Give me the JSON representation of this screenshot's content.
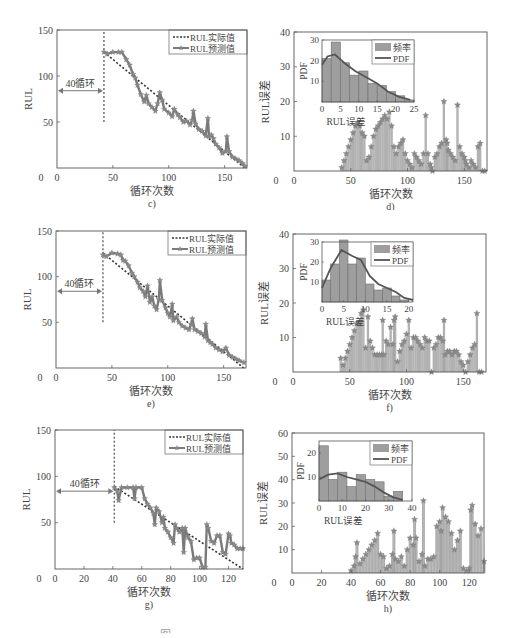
{
  "figure_caption_partial": "图",
  "colors": {
    "frame": "#555555",
    "actual_line": "#333333",
    "predicted_line": "#7a7a7a",
    "marker": "#8a8a8a",
    "bar_fill": "#9e9e9e",
    "bar_stroke": "#6f6f6f",
    "stem": "#bdbdbd",
    "pdf_line": "#555555",
    "text": "#444444"
  },
  "panels": [
    {
      "id": "c",
      "label": "c)",
      "type": "rul",
      "xlabel": "循环次数",
      "ylabel": "RUL",
      "annotation": "40循环",
      "legend": [
        "RUL实际值",
        "RUL预测值"
      ]
    },
    {
      "id": "d",
      "label": "d)",
      "type": "err",
      "xlabel": "循环次数",
      "ylabel": "RUL误差",
      "inset_xlabel": "RUL误差",
      "inset_ylabel": "PDF",
      "legend": [
        "频率",
        "PDF"
      ]
    },
    {
      "id": "e",
      "label": "e)",
      "type": "rul",
      "xlabel": "循环次数",
      "ylabel": "RUL",
      "annotation": "40循环",
      "legend": [
        "RUL实际值",
        "RUL预测值"
      ]
    },
    {
      "id": "f",
      "label": "f)",
      "type": "err",
      "xlabel": "循环次数",
      "ylabel": "RUL误差",
      "inset_xlabel": "RUL误差",
      "inset_ylabel": "PDF",
      "legend": [
        "频率",
        "PDF"
      ]
    },
    {
      "id": "g",
      "label": "g)",
      "type": "rul",
      "xlabel": "循环次数",
      "ylabel": "RUL",
      "annotation": "40循环",
      "legend": [
        "RUL实际值",
        "RUL预测值"
      ]
    },
    {
      "id": "h",
      "label": "h)",
      "type": "err",
      "xlabel": "循环次数",
      "ylabel": "RUL误差",
      "inset_xlabel": "RUL误差",
      "inset_ylabel": "PDF",
      "legend": [
        "频率",
        "PDF"
      ]
    }
  ],
  "chart_data": [
    {
      "panel": "c",
      "type": "line",
      "title": "c)",
      "xlabel": "循环次数",
      "ylabel": "RUL",
      "xlim": [
        0,
        170
      ],
      "ylim": [
        0,
        150
      ],
      "xticks": [
        0,
        50,
        100,
        150
      ],
      "yticks": [
        50,
        100,
        150
      ],
      "annotation": {
        "text": "40循环",
        "x_from": 0,
        "x_to": 42,
        "y": 84
      },
      "vline": {
        "x": 42,
        "y_from": 50,
        "y_to": 150
      },
      "legend": [
        "RUL实际值",
        "RUL预测值"
      ],
      "series": [
        {
          "name": "RUL实际值",
          "style": "dotted",
          "x": [
            42,
            168
          ],
          "y": [
            126,
            0
          ]
        },
        {
          "name": "RUL预测值",
          "style": "line-star",
          "x": [
            42,
            45,
            50,
            55,
            58,
            62,
            65,
            68,
            70,
            72,
            75,
            78,
            80,
            82,
            85,
            88,
            90,
            92,
            94,
            96,
            100,
            103,
            105,
            108,
            110,
            113,
            116,
            119,
            121,
            122,
            124,
            127,
            130,
            133,
            135,
            136,
            138,
            140,
            142,
            145,
            148,
            151,
            152,
            154,
            157,
            160,
            163,
            166,
            168
          ],
          "y": [
            126,
            124,
            126,
            126,
            126,
            118,
            112,
            102,
            98,
            90,
            80,
            72,
            79,
            70,
            66,
            62,
            70,
            82,
            74,
            64,
            60,
            56,
            64,
            58,
            55,
            50,
            51,
            47,
            52,
            62,
            48,
            42,
            40,
            35,
            54,
            34,
            36,
            32,
            26,
            22,
            16,
            18,
            34,
            18,
            12,
            10,
            8,
            5,
            2
          ]
        }
      ]
    },
    {
      "panel": "d",
      "type": "bar",
      "title": "d)",
      "xlabel": "循环次数",
      "ylabel": "RUL误差",
      "xlim": [
        0,
        170
      ],
      "ylim": [
        0,
        40
      ],
      "xticks": [
        0,
        50,
        100,
        150
      ],
      "yticks": [
        0,
        10,
        20,
        30,
        40
      ],
      "x": [
        42,
        44,
        46,
        48,
        50,
        52,
        54,
        56,
        58,
        60,
        62,
        64,
        66,
        68,
        70,
        72,
        74,
        76,
        78,
        80,
        82,
        84,
        86,
        88,
        90,
        92,
        94,
        96,
        98,
        100,
        102,
        104,
        106,
        108,
        110,
        112,
        114,
        116,
        118,
        120,
        121,
        122,
        124,
        126,
        128,
        130,
        132,
        134,
        135,
        136,
        138,
        140,
        142,
        144,
        146,
        148,
        150,
        151,
        152,
        154,
        156,
        158,
        160,
        162,
        164,
        166,
        168
      ],
      "values": [
        1,
        3,
        5,
        7,
        9,
        11,
        13,
        14,
        13,
        11,
        10,
        3,
        4,
        7,
        10,
        12,
        13,
        14,
        15,
        16,
        15,
        17,
        13,
        7,
        5,
        7,
        8,
        9,
        5,
        3,
        2,
        1,
        5,
        4,
        3,
        2,
        5,
        16,
        5,
        2,
        1,
        0,
        4,
        5,
        7,
        8,
        20,
        9,
        8,
        6,
        5,
        4,
        3,
        19,
        7,
        5,
        4,
        3,
        2,
        1,
        3,
        2,
        1,
        7,
        8,
        0,
        0
      ],
      "inset": {
        "type": "histogram",
        "xlabel": "RUL误差",
        "ylabel": "PDF",
        "xlim": [
          0,
          25
        ],
        "ylim": [
          0,
          30
        ],
        "xticks": [
          0,
          5,
          10,
          15,
          20,
          25
        ],
        "yticks": [
          10,
          20,
          30
        ],
        "bin_width": 2.5,
        "bins": [
          0,
          2.5,
          5,
          7.5,
          10,
          12.5,
          15,
          17.5,
          20,
          22.5
        ],
        "frequency": [
          21,
          29,
          19,
          13,
          15,
          9,
          8,
          5,
          3,
          1
        ],
        "pdf_x": [
          0,
          1.5,
          3.5,
          6,
          9,
          12,
          15,
          18,
          21,
          24
        ],
        "pdf_y": [
          18,
          22,
          23,
          19,
          15,
          12,
          9,
          5,
          2.5,
          1
        ],
        "legend": [
          "频率",
          "PDF"
        ]
      }
    },
    {
      "panel": "e",
      "type": "line",
      "title": "e)",
      "xlabel": "循环次数",
      "ylabel": "RUL",
      "xlim": [
        0,
        170
      ],
      "ylim": [
        0,
        150
      ],
      "xticks": [
        0,
        50,
        100,
        150
      ],
      "yticks": [
        50,
        100,
        150
      ],
      "annotation": {
        "text": "40循环",
        "x_from": 0,
        "x_to": 42,
        "y": 84
      },
      "vline": {
        "x": 42,
        "y_from": 50,
        "y_to": 150
      },
      "legend": [
        "RUL实际值",
        "RUL预测值"
      ],
      "series": [
        {
          "name": "RUL实际值",
          "style": "dotted",
          "x": [
            42,
            168
          ],
          "y": [
            126,
            0
          ]
        },
        {
          "name": "RUL预测值",
          "style": "line-star",
          "x": [
            42,
            45,
            50,
            55,
            58,
            60,
            62,
            65,
            68,
            70,
            73,
            75,
            78,
            80,
            82,
            84,
            86,
            88,
            90,
            92,
            93,
            95,
            98,
            100,
            102,
            104,
            105,
            108,
            110,
            113,
            116,
            119,
            121,
            122,
            124,
            127,
            130,
            133,
            134,
            136,
            138,
            140,
            143,
            146,
            149,
            152,
            155,
            158,
            161,
            164,
            168
          ],
          "y": [
            124,
            122,
            126,
            125,
            124,
            118,
            117,
            112,
            104,
            100,
            94,
            88,
            84,
            78,
            90,
            72,
            78,
            68,
            64,
            75,
            96,
            74,
            66,
            60,
            56,
            70,
            52,
            56,
            50,
            46,
            44,
            42,
            48,
            54,
            42,
            40,
            38,
            34,
            48,
            30,
            28,
            26,
            22,
            20,
            18,
            22,
            14,
            12,
            10,
            8,
            6
          ]
        }
      ]
    },
    {
      "panel": "f",
      "type": "bar",
      "title": "f)",
      "xlabel": "循环次数",
      "ylabel": "RUL误差",
      "xlim": [
        0,
        170
      ],
      "ylim": [
        0,
        40
      ],
      "xticks": [
        0,
        50,
        100,
        150
      ],
      "yticks": [
        0,
        10,
        20,
        30,
        40
      ],
      "x": [
        42,
        44,
        46,
        48,
        50,
        52,
        54,
        56,
        58,
        60,
        62,
        64,
        66,
        68,
        70,
        72,
        74,
        76,
        78,
        79,
        80,
        82,
        84,
        86,
        88,
        89,
        90,
        92,
        94,
        96,
        98,
        100,
        102,
        104,
        106,
        108,
        110,
        112,
        114,
        116,
        118,
        120,
        122,
        124,
        126,
        128,
        130,
        132,
        133,
        134,
        136,
        138,
        140,
        142,
        144,
        146,
        148,
        150,
        152,
        154,
        156,
        158,
        160,
        162,
        164,
        166
      ],
      "values": [
        4,
        2,
        4,
        6,
        8,
        10,
        12,
        14,
        14,
        17,
        18,
        7,
        16,
        9,
        7,
        5,
        5,
        5,
        5,
        15,
        5,
        9,
        8,
        13,
        8,
        15,
        16,
        3,
        6,
        8,
        9,
        11,
        15,
        7,
        10,
        10,
        9,
        8,
        7,
        10,
        9,
        9,
        0,
        7,
        8,
        10,
        10,
        9,
        15,
        5,
        6,
        6,
        5,
        6,
        6,
        5,
        3,
        2,
        0,
        3,
        5,
        7,
        8,
        17,
        0,
        0
      ],
      "inset": {
        "type": "histogram",
        "xlabel": "RUL误差",
        "ylabel": "PDF",
        "xlim": [
          0,
          21
        ],
        "ylim": [
          0,
          30
        ],
        "xticks": [
          0,
          5,
          10,
          15,
          20
        ],
        "yticks": [
          10,
          20,
          30
        ],
        "bin_width": 2,
        "bins": [
          0,
          2,
          4,
          6,
          8,
          10,
          12,
          14,
          16,
          18
        ],
        "frequency": [
          11,
          19,
          31,
          19,
          22,
          9,
          6,
          7,
          3,
          1
        ],
        "pdf_x": [
          0,
          2,
          4.5,
          7,
          9,
          11,
          13,
          15,
          17,
          19,
          21
        ],
        "pdf_y": [
          7,
          17,
          26,
          23,
          21,
          13,
          9,
          7,
          5,
          2,
          1
        ],
        "legend": [
          "频率",
          "PDF"
        ]
      }
    },
    {
      "panel": "g",
      "type": "line",
      "title": "g)",
      "xlabel": "循环次数",
      "ylabel": "RUL",
      "xlim": [
        0,
        130
      ],
      "ylim": [
        0,
        150
      ],
      "xticks": [
        0,
        20,
        40,
        60,
        80,
        100,
        120
      ],
      "yticks": [
        50,
        100,
        150
      ],
      "annotation": {
        "text": "40循环",
        "x_from": 0,
        "x_to": 41,
        "y": 84
      },
      "vline": {
        "x": 41,
        "y_from": 50,
        "y_to": 150
      },
      "legend": [
        "RUL实际值",
        "RUL预测值"
      ],
      "series": [
        {
          "name": "RUL实际值",
          "style": "dotted",
          "x": [
            41,
            130
          ],
          "y": [
            89,
            0
          ]
        },
        {
          "name": "RUL预测值",
          "style": "line-star",
          "x": [
            41,
            43,
            44,
            46,
            50,
            54,
            55,
            56,
            60,
            62,
            64,
            66,
            68,
            69,
            70,
            72,
            74,
            75,
            76,
            78,
            80,
            82,
            83,
            84,
            86,
            88,
            89,
            90,
            92,
            94,
            96,
            98,
            100,
            102,
            104,
            105,
            106,
            108,
            110,
            112,
            114,
            116,
            118,
            120,
            121,
            122,
            124,
            126,
            128,
            130
          ],
          "y": [
            88,
            84,
            74,
            88,
            88,
            88,
            76,
            88,
            88,
            76,
            70,
            66,
            60,
            48,
            66,
            62,
            50,
            56,
            44,
            40,
            34,
            28,
            48,
            44,
            40,
            44,
            18,
            44,
            34,
            30,
            10,
            12,
            12,
            2,
            2,
            48,
            44,
            30,
            28,
            36,
            36,
            18,
            16,
            38,
            36,
            28,
            26,
            22,
            22,
            22
          ]
        }
      ]
    },
    {
      "panel": "h",
      "type": "bar",
      "title": "h)",
      "xlabel": "循环次数",
      "ylabel": "RUL误差",
      "xlim": [
        0,
        130
      ],
      "ylim": [
        0,
        60
      ],
      "xticks": [
        0,
        20,
        40,
        60,
        80,
        100,
        120
      ],
      "yticks": [
        0,
        10,
        20,
        30,
        40,
        50,
        60
      ],
      "x": [
        40,
        42,
        43,
        44,
        46,
        48,
        50,
        52,
        54,
        56,
        58,
        60,
        62,
        64,
        66,
        68,
        69,
        70,
        72,
        74,
        76,
        78,
        80,
        82,
        83,
        84,
        86,
        88,
        89,
        90,
        92,
        94,
        96,
        98,
        100,
        101,
        102,
        104,
        106,
        108,
        110,
        112,
        114,
        116,
        118,
        120,
        121,
        122,
        124,
        126,
        128,
        130
      ],
      "values": [
        1,
        3,
        7,
        13,
        4,
        6,
        8,
        10,
        12,
        14,
        17,
        8,
        7,
        2,
        3,
        8,
        18,
        6,
        5,
        7,
        3,
        10,
        15,
        12,
        23,
        15,
        5,
        8,
        31,
        3,
        6,
        6,
        7,
        20,
        22,
        18,
        28,
        24,
        22,
        17,
        10,
        14,
        18,
        2,
        1,
        2,
        27,
        29,
        21,
        16,
        19,
        5
      ],
      "inset": {
        "type": "histogram",
        "xlabel": "RUL误差",
        "ylabel": "PDF",
        "xlim": [
          0,
          40
        ],
        "ylim": [
          0,
          25
        ],
        "xticks": [
          0,
          10,
          20,
          30,
          40
        ],
        "yticks": [
          10,
          20
        ],
        "bin_width": 4,
        "bins": [
          0,
          4,
          8,
          12,
          16,
          20,
          24,
          28,
          32
        ],
        "frequency": [
          23,
          9,
          12,
          6,
          11,
          9,
          8,
          2,
          4
        ],
        "pdf_x": [
          0,
          4,
          8,
          12,
          16,
          20,
          24,
          28,
          32,
          36
        ],
        "pdf_y": [
          9,
          11,
          11.5,
          10,
          9,
          8,
          6,
          3.5,
          1.5,
          0.5
        ],
        "legend": [
          "频率",
          "PDF"
        ]
      }
    }
  ]
}
